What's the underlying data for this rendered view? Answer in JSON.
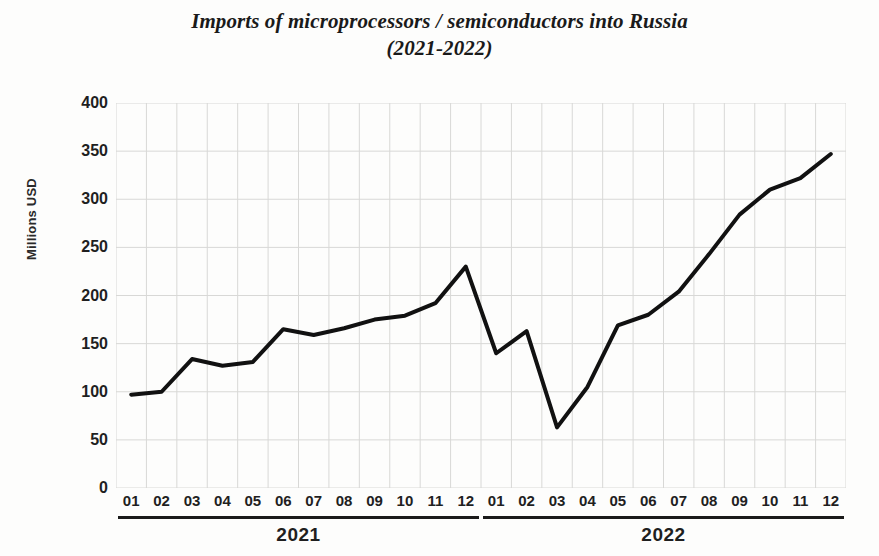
{
  "chart_data": {
    "type": "line",
    "title": "Imports of microprocessors / semiconductors into Russia (2021-2022)",
    "title_lines": [
      "Imports of microprocessors / semiconductors into Russia",
      "(2021-2022)"
    ],
    "xlabel": "",
    "ylabel": "Millions USD",
    "ylim": [
      0,
      400
    ],
    "ytick_step": 50,
    "yticks": [
      400,
      350,
      300,
      250,
      200,
      150,
      100,
      50,
      0
    ],
    "ytick_labels": [
      "400",
      "350",
      "300",
      "250",
      "200",
      "150",
      "100",
      "50",
      "0"
    ],
    "grid": true,
    "legend": false,
    "legend_position": "none",
    "line_color": "#111111",
    "line_width": 4,
    "grid_color": "#d8d8d6",
    "background_color": "#fdfdfc",
    "x": [
      "2021-01",
      "2021-02",
      "2021-03",
      "2021-04",
      "2021-05",
      "2021-06",
      "2021-07",
      "2021-08",
      "2021-09",
      "2021-10",
      "2021-11",
      "2021-12",
      "2022-01",
      "2022-02",
      "2022-03",
      "2022-04",
      "2022-05",
      "2022-06",
      "2022-07",
      "2022-08",
      "2022-09",
      "2022-10",
      "2022-11",
      "2022-12"
    ],
    "categories": [
      "01",
      "02",
      "03",
      "04",
      "05",
      "06",
      "07",
      "08",
      "09",
      "10",
      "11",
      "12",
      "01",
      "02",
      "03",
      "04",
      "05",
      "06",
      "07",
      "08",
      "09",
      "10",
      "11",
      "12"
    ],
    "values": [
      97,
      100,
      134,
      127,
      131,
      165,
      159,
      166,
      175,
      179,
      192,
      230,
      140,
      163,
      63,
      105,
      169,
      180,
      204,
      243,
      284,
      310,
      322,
      347
    ],
    "groups": [
      {
        "label": "2021",
        "start_index": 0,
        "end_index": 11
      },
      {
        "label": "2022",
        "start_index": 12,
        "end_index": 23
      }
    ],
    "units": "Millions USD",
    "annotations": []
  }
}
